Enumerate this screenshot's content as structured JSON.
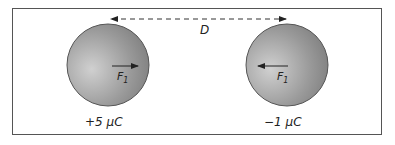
{
  "diagram": {
    "distance_label": "D",
    "spheres": [
      {
        "id": "left",
        "charge_label": "+5 μC",
        "force_label": "F",
        "force_subscript": "1",
        "force_direction": "right"
      },
      {
        "id": "right",
        "charge_label": "−1 μC",
        "force_label": "F",
        "force_subscript": "1",
        "force_direction": "left"
      }
    ]
  }
}
